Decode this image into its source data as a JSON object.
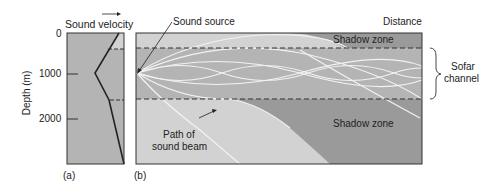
{
  "panel_a": {
    "label": "(a)",
    "axis_title": "Sound velocity",
    "y_axis_label": "Depth (m)",
    "y_ticks": [
      "0",
      "1000",
      "2000"
    ]
  },
  "panel_b": {
    "label": "(b)",
    "x_axis_title": "Distance",
    "annotations": {
      "sound_source": "Sound source",
      "shadow_zone_top": "Shadow zone",
      "shadow_zone_bottom": "Shadow zone",
      "path_line1": "Path of",
      "path_line2": "sound beam",
      "sofar_line1": "Sofar",
      "sofar_line2": "channel"
    }
  },
  "colors": {
    "shadow": "#9a9a9a",
    "channel": "#b4b4b4",
    "light": "#d2d2d2",
    "ray": "#f2f2f2",
    "ink": "#222222"
  }
}
